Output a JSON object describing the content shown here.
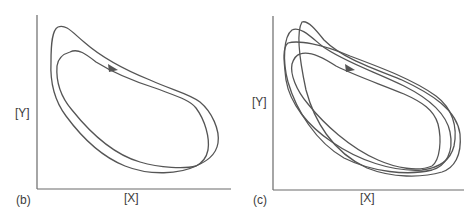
{
  "figure": {
    "line_color": "#555555",
    "axis_color": "#6a6a6a",
    "panels": [
      {
        "id": "b",
        "panel_label": "(b)",
        "x_label": "[X]",
        "y_label": "[Y]",
        "description": "Two nearly coincident closed trajectories (period-2 style limit cycle) in the X-Y phase plane, with a direction arrow on the upper branch."
      },
      {
        "id": "c",
        "panel_label": "(c)",
        "x_label": "[X]",
        "y_label": "[Y]",
        "description": "Multiple interleaved closed trajectories (higher-period / chaotic-like orbit) in the X-Y phase plane, with a direction arrow on the upper branch."
      }
    ]
  }
}
